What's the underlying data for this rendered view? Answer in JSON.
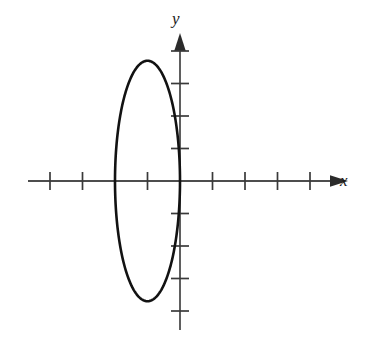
{
  "figure": {
    "title": "",
    "background_color": "#ffffff",
    "width": 368,
    "height": 344
  },
  "axes": {
    "x_label": "x",
    "y_label": "y",
    "axis_color": "#4d4d4d",
    "tick_color": "#3a3a3a",
    "curve_color": "#121212",
    "x_tick_count_left": 4,
    "x_tick_count_right": 4,
    "y_tick_count_up": 4,
    "y_tick_count_down": 4,
    "tick_spacing_px": 32.5,
    "origin_px": {
      "x": 180,
      "y": 181
    },
    "arrow_heads": [
      "x-positive",
      "y-positive"
    ]
  },
  "chart_data": {
    "type": "line",
    "title": "",
    "xlabel": "x",
    "ylabel": "y",
    "grid": false,
    "legend": null,
    "xlim": [
      -4,
      4.6
    ],
    "ylim": [
      -4.3,
      3.6
    ],
    "xticks": [
      -4,
      -3,
      -2,
      -1,
      1,
      2,
      3,
      4
    ],
    "yticks": [
      -4,
      -3,
      -2,
      -1,
      1,
      2,
      3
    ],
    "xtick_labels": [
      "",
      "",
      "",
      "",
      "",
      "",
      "",
      ""
    ],
    "ytick_labels": [
      "",
      "",
      "",
      "",
      "",
      "",
      ""
    ],
    "annotations": [],
    "series": [
      {
        "name": "ellipse",
        "kind": "ellipse",
        "center": [
          -1,
          0
        ],
        "semi_axis_x": 1,
        "semi_axis_y": 3.7,
        "equation": "(x + 1)^2/1 + y^2/13.69 = 1",
        "closed": true,
        "line_width_px": 2.6,
        "color": "#121212",
        "x_extent": [
          -2,
          0
        ],
        "y_extent": [
          -3.7,
          3.7
        ],
        "vertices": [
          [
            -1,
            3.7
          ],
          [
            -1,
            -3.7
          ]
        ],
        "co_vertices": [
          [
            -2,
            0
          ],
          [
            0,
            0
          ]
        ],
        "points": [
          [
            0.0,
            0.0
          ],
          [
            -0.0381,
            1.0465
          ],
          [
            -0.1522,
            2.0046
          ],
          [
            -0.3318,
            2.7996
          ],
          [
            -0.5611,
            3.3716
          ],
          [
            -0.8211,
            3.6807
          ],
          [
            -1.0,
            3.7
          ],
          [
            -1.1789,
            3.6807
          ],
          [
            -1.4389,
            3.3716
          ],
          [
            -1.6682,
            2.7996
          ],
          [
            -1.8478,
            2.0046
          ],
          [
            -1.9619,
            1.0465
          ],
          [
            -2.0,
            0.0
          ],
          [
            -1.9619,
            -1.0465
          ],
          [
            -1.8478,
            -2.0046
          ],
          [
            -1.6682,
            -2.7996
          ],
          [
            -1.4389,
            -3.3716
          ],
          [
            -1.1789,
            -3.6807
          ],
          [
            -1.0,
            -3.7
          ],
          [
            -0.8211,
            -3.6807
          ],
          [
            -0.5611,
            -3.3716
          ],
          [
            -0.3318,
            -2.7996
          ],
          [
            -0.1522,
            -2.0046
          ],
          [
            -0.0381,
            -1.0465
          ],
          [
            0.0,
            0.0
          ]
        ]
      }
    ]
  }
}
